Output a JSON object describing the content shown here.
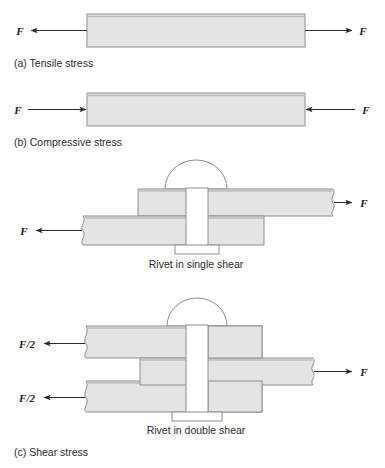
{
  "figure": {
    "background": "#ffffff",
    "plate_fill": "#e3e5e5",
    "plate_fill_light": "#eceeee",
    "plate_stroke": "#8a8f90",
    "plate_top_edge": "#9b9fa0",
    "rivet_fill": "#ffffff",
    "rivet_stroke": "#8a8f90",
    "arrow_color": "#2b2b2b",
    "text_color": "#2b2b2b"
  },
  "panels": [
    {
      "id": "a",
      "caption": "(a) Tensile stress",
      "force_left": "F",
      "force_right": "F",
      "direction": "outward"
    },
    {
      "id": "b",
      "caption": "(b) Compressive stress",
      "force_left": "F",
      "force_right": "F",
      "direction": "inward"
    },
    {
      "id": "c",
      "caption": "(c) Shear stress",
      "sub_captions": [
        "Rivet in single shear",
        "Rivet in double shear"
      ],
      "single_shear": {
        "caption": "Rivet in single shear",
        "force_left": "F",
        "force_right": "F"
      },
      "double_shear": {
        "caption": "Rivet in double shear",
        "force_top_left": "F/2",
        "force_bottom_left": "F/2",
        "force_right": "F"
      }
    }
  ],
  "labels": {
    "a_caption": "(a) Tensile stress",
    "b_caption": "(b) Compressive stress",
    "c_caption": "(c) Shear stress",
    "single_shear_caption": "Rivet in single shear",
    "double_shear_caption": "Rivet in double shear",
    "F": "F",
    "F_half": "F/2"
  }
}
